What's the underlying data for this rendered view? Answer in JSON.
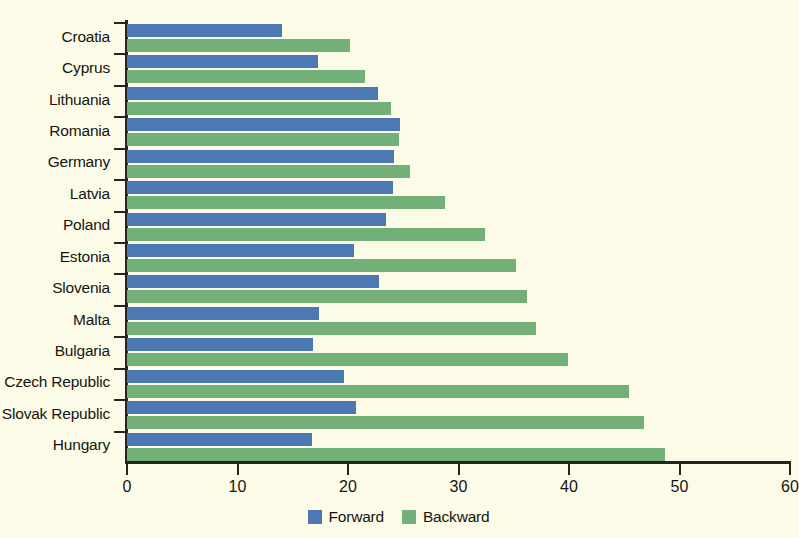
{
  "chart_data": {
    "type": "bar",
    "orientation": "horizontal",
    "title": "",
    "subtitle": "",
    "xlabel": "",
    "ylabel": "",
    "xlim": [
      0,
      60
    ],
    "ylim": null,
    "grid": false,
    "legend_position": "bottom-center",
    "categories": [
      "Croatia",
      "Cyprus",
      "Lithuania",
      "Romania",
      "Germany",
      "Latvia",
      "Poland",
      "Estonia",
      "Slovenia",
      "Malta",
      "Bulgaria",
      "Czech Republic",
      "Slovak Republic",
      "Hungary"
    ],
    "x_ticks": [
      0,
      10,
      20,
      30,
      40,
      50,
      60
    ],
    "x_tick_labels": [
      "0",
      "10",
      "20",
      "30",
      "40",
      "50",
      "60"
    ],
    "series": [
      {
        "name": "Forward",
        "color": "#4c78b4",
        "values": [
          14.0,
          17.3,
          22.7,
          24.7,
          24.2,
          24.1,
          23.4,
          20.5,
          22.8,
          17.4,
          16.8,
          19.6,
          20.7,
          16.7
        ]
      },
      {
        "name": "Backward",
        "color": "#72b078",
        "values": [
          20.2,
          21.5,
          23.9,
          24.6,
          25.6,
          28.8,
          32.4,
          35.2,
          36.2,
          37.0,
          39.9,
          45.4,
          46.8,
          48.7
        ]
      }
    ]
  },
  "legend": {
    "items": [
      {
        "label": "Forward",
        "color": "#4c78b4"
      },
      {
        "label": "Backward",
        "color": "#72b078"
      }
    ]
  },
  "colors": {
    "background": "#fcfbe8",
    "axis": "#262420",
    "text": "#17150f",
    "forward": "#4c78b4",
    "backward": "#72b078"
  }
}
